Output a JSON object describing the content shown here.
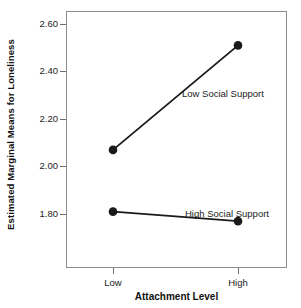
{
  "chart_data": {
    "type": "line",
    "title": "",
    "subtitle": "",
    "xlabel": "Attachment Level",
    "ylabel": "Estimated Marginal Means for Loneliness",
    "categories": [
      "Low",
      "High"
    ],
    "xtick_labels": [
      "Low",
      "High"
    ],
    "ytick_labels": [
      "2.60",
      "2.40",
      "2.20",
      "2.00",
      "1.80"
    ],
    "ytick_values": [
      2.6,
      2.4,
      2.2,
      2.0,
      1.8
    ],
    "ylim": [
      1.7,
      2.65
    ],
    "grid": false,
    "legend_position": "inline-annotations",
    "marker": "filled-circle",
    "line_color": "#1a1a1a",
    "marker_color": "#1a1a1a",
    "frame_color": "#8c8c8c",
    "background_color": "#ffffff",
    "series": [
      {
        "name": "Low Social Support",
        "values": [
          2.07,
          2.51
        ],
        "points": [
          {
            "x": "Low",
            "y": 2.07
          },
          {
            "x": "High",
            "y": 2.51
          }
        ]
      },
      {
        "name": "High Social Support",
        "values": [
          1.81,
          1.77
        ],
        "points": [
          {
            "x": "Low",
            "y": 1.81
          },
          {
            "x": "High",
            "y": 1.77
          }
        ]
      }
    ],
    "annotations": [
      {
        "text": "Low Social Support",
        "series": "Low Social Support"
      },
      {
        "text": "High Social Support",
        "series": "High Social Support"
      }
    ]
  }
}
